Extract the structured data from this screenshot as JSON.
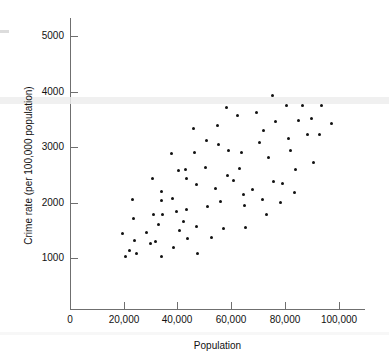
{
  "chart_data": {
    "type": "scatter",
    "title": "",
    "xlabel": "Population",
    "ylabel": "Crime rate (per 100,000 population)",
    "xlim": [
      0,
      108000
    ],
    "ylim": [
      0,
      5300
    ],
    "grid": false,
    "legend": null,
    "xticks": [
      0,
      20000,
      40000,
      60000,
      80000,
      100000
    ],
    "xticklabels": [
      "0",
      "20,000",
      "40,000",
      "60,000",
      "80,000",
      "100,000"
    ],
    "yticks": [
      1000,
      2000,
      3000,
      4000,
      5000
    ],
    "yticklabels": [
      "1000",
      "2000",
      "3000",
      "4000",
      "5000"
    ],
    "marker": "filled-circle",
    "marker_color": "#111111",
    "points": [
      {
        "x": 19500,
        "y": 1450
      },
      {
        "x": 20800,
        "y": 1030
      },
      {
        "x": 22200,
        "y": 1140
      },
      {
        "x": 23200,
        "y": 2060
      },
      {
        "x": 23500,
        "y": 1720
      },
      {
        "x": 23900,
        "y": 1310
      },
      {
        "x": 24600,
        "y": 1080
      },
      {
        "x": 28600,
        "y": 1460
      },
      {
        "x": 29900,
        "y": 1270
      },
      {
        "x": 30800,
        "y": 2440
      },
      {
        "x": 31100,
        "y": 1780
      },
      {
        "x": 32000,
        "y": 1300
      },
      {
        "x": 33000,
        "y": 1610
      },
      {
        "x": 34000,
        "y": 2200
      },
      {
        "x": 34000,
        "y": 1030
      },
      {
        "x": 34200,
        "y": 2030
      },
      {
        "x": 34600,
        "y": 1790
      },
      {
        "x": 37900,
        "y": 2880
      },
      {
        "x": 38100,
        "y": 2080
      },
      {
        "x": 38600,
        "y": 1190
      },
      {
        "x": 39600,
        "y": 1840
      },
      {
        "x": 40500,
        "y": 2570
      },
      {
        "x": 40700,
        "y": 1490
      },
      {
        "x": 42100,
        "y": 1650
      },
      {
        "x": 43000,
        "y": 2600
      },
      {
        "x": 43200,
        "y": 2440
      },
      {
        "x": 43500,
        "y": 1880
      },
      {
        "x": 43600,
        "y": 1360
      },
      {
        "x": 46000,
        "y": 3340
      },
      {
        "x": 46500,
        "y": 2910
      },
      {
        "x": 47000,
        "y": 2330
      },
      {
        "x": 47000,
        "y": 1560
      },
      {
        "x": 47300,
        "y": 1090
      },
      {
        "x": 50500,
        "y": 2630
      },
      {
        "x": 51000,
        "y": 3110
      },
      {
        "x": 51200,
        "y": 1920
      },
      {
        "x": 52500,
        "y": 1370
      },
      {
        "x": 54000,
        "y": 2250
      },
      {
        "x": 55000,
        "y": 3380
      },
      {
        "x": 55200,
        "y": 3050
      },
      {
        "x": 56000,
        "y": 2020
      },
      {
        "x": 57000,
        "y": 1530
      },
      {
        "x": 58200,
        "y": 3710
      },
      {
        "x": 58500,
        "y": 2480
      },
      {
        "x": 59000,
        "y": 2930
      },
      {
        "x": 61000,
        "y": 2400
      },
      {
        "x": 62500,
        "y": 3570
      },
      {
        "x": 63000,
        "y": 2610
      },
      {
        "x": 64000,
        "y": 2900
      },
      {
        "x": 64500,
        "y": 2140
      },
      {
        "x": 65000,
        "y": 1940
      },
      {
        "x": 65500,
        "y": 1550
      },
      {
        "x": 68000,
        "y": 2240
      },
      {
        "x": 69500,
        "y": 3620
      },
      {
        "x": 70500,
        "y": 3080
      },
      {
        "x": 71500,
        "y": 2050
      },
      {
        "x": 72000,
        "y": 3300
      },
      {
        "x": 73000,
        "y": 1790
      },
      {
        "x": 74000,
        "y": 2820
      },
      {
        "x": 75500,
        "y": 3930
      },
      {
        "x": 75800,
        "y": 2380
      },
      {
        "x": 76500,
        "y": 3460
      },
      {
        "x": 78500,
        "y": 2000
      },
      {
        "x": 79000,
        "y": 2340
      },
      {
        "x": 80500,
        "y": 3740
      },
      {
        "x": 81500,
        "y": 3160
      },
      {
        "x": 82000,
        "y": 2930
      },
      {
        "x": 83500,
        "y": 2180
      },
      {
        "x": 84000,
        "y": 2590
      },
      {
        "x": 85000,
        "y": 3480
      },
      {
        "x": 86500,
        "y": 3740
      },
      {
        "x": 88500,
        "y": 3230
      },
      {
        "x": 90000,
        "y": 3510
      },
      {
        "x": 90500,
        "y": 2730
      },
      {
        "x": 93000,
        "y": 3220
      },
      {
        "x": 93500,
        "y": 3750
      },
      {
        "x": 97500,
        "y": 3430
      }
    ]
  },
  "axes": {
    "y_title": "Crime rate (per 100,000 population)",
    "x_title": "Population",
    "x_tick_labels": [
      "0",
      "20,000",
      "40,000",
      "60,000",
      "80,000",
      "100,000"
    ],
    "y_tick_labels": [
      "1000",
      "2000",
      "3000",
      "4000",
      "5000"
    ]
  },
  "style": {
    "axis_color": "#6f6f6f",
    "marker_color": "#111111",
    "background": "#ffffff",
    "artifact_color": "#ededed"
  }
}
